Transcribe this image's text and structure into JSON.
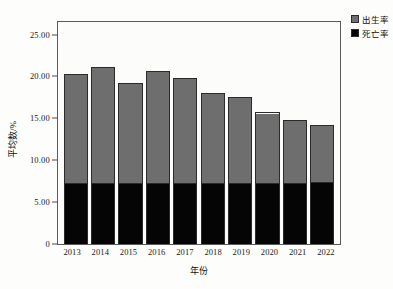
{
  "chart_data": {
    "type": "bar",
    "stacked": true,
    "title": "",
    "xlabel": "年份",
    "ylabel": "平均数/%",
    "categories": [
      "2013",
      "2014",
      "2015",
      "2016",
      "2017",
      "2018",
      "2019",
      "2020",
      "2021",
      "2022"
    ],
    "series": [
      {
        "name": "死亡率",
        "color": "#050505",
        "values": [
          7.3,
          7.3,
          7.3,
          7.3,
          7.3,
          7.3,
          7.3,
          7.3,
          7.3,
          7.5
        ]
      },
      {
        "name": "出生率",
        "color": "#6e6e6e",
        "values": [
          13.0,
          13.8,
          11.9,
          13.3,
          12.5,
          10.7,
          10.3,
          8.4,
          7.5,
          6.7
        ]
      }
    ],
    "totals": [
      20.3,
      21.1,
      19.2,
      20.6,
      19.8,
      18.0,
      17.6,
      15.7,
      14.8,
      14.2
    ],
    "ylim": [
      0,
      26.5
    ],
    "ytick_values": [
      0,
      5,
      10,
      15,
      20,
      25
    ],
    "ytick_labels": [
      "0",
      "5.00",
      "10.00",
      "15.00",
      "20.00",
      "25.00"
    ],
    "grid": false,
    "legend_position": "top-right"
  },
  "legend": {
    "items": [
      {
        "label": "出生率",
        "swatch": "gray-swatch-icon"
      },
      {
        "label": "死亡率",
        "swatch": "black-swatch-icon"
      }
    ]
  }
}
